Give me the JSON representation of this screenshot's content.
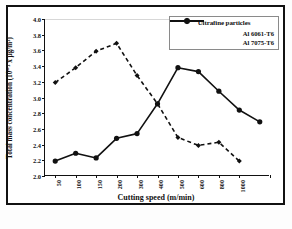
{
  "chart_data": {
    "type": "line",
    "title": "",
    "xlabel": "Cutting speed (m/min)",
    "ylabel": "Total mass concentration (10⁻³ x µg/m³)",
    "categories": [
      "50",
      "100",
      "150",
      "200",
      "300",
      "400",
      "500",
      "600",
      "800",
      "1000",
      ""
    ],
    "x_tick_labels": [
      "50",
      "100",
      "150",
      "200",
      "300",
      "400",
      "500",
      "600",
      "800",
      "1000"
    ],
    "y_tick_labels": [
      "2.0",
      "2.2",
      "2.4",
      "2.6",
      "2.8",
      "3.0",
      "3.2",
      "3.4",
      "3.6",
      "3.8",
      "4.0"
    ],
    "ylim": [
      2.0,
      4.0
    ],
    "y_tick_step": 0.2,
    "grid": false,
    "legend_position": "top-right",
    "legend_title": "Ultrafine particles",
    "series": [
      {
        "name": "Al 6061-T6",
        "style": "dashed",
        "marker": "diamond",
        "color": "#111111",
        "values": [
          3.19,
          3.38,
          3.59,
          3.69,
          3.28,
          2.92,
          2.49,
          2.39,
          2.43,
          2.19,
          null
        ]
      },
      {
        "name": "Al 7075-T6",
        "style": "solid",
        "marker": "circle",
        "color": "#111111",
        "values": [
          2.19,
          2.29,
          2.23,
          2.48,
          2.54,
          2.92,
          3.38,
          3.33,
          3.08,
          2.84,
          2.69
        ]
      }
    ]
  },
  "legend": {
    "title": "Ultrafine particles",
    "entries": [
      {
        "label": "Al 6061-T6"
      },
      {
        "label": "Al 7075-T6"
      }
    ]
  },
  "axes": {
    "x_title": "Cutting speed (m/min)",
    "y_title": "Total mass concentration (10⁻³ x µg/m³)"
  }
}
